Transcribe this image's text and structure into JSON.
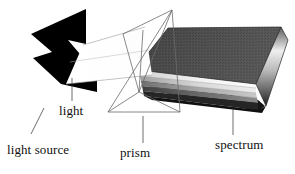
{
  "figure": {
    "width": 295,
    "height": 174,
    "background_color": "#ffffff",
    "style": "grayscale line-and-tone scientific illustration"
  },
  "labels": {
    "light": "light",
    "light_source": "light source",
    "prism": "prism",
    "spectrum": "spectrum"
  },
  "colors": {
    "background": "#ffffff",
    "ink": "#101010",
    "light_source_fill": "#000000",
    "prism_outline": "#6b6b6b",
    "beam_fill": "#ffffff",
    "beam_outline": "#9a9a9a",
    "spectrum_top": "#4a4a4a",
    "spectrum_top_dark": "#2f2f2f",
    "spectrum_base_dark": "#1a1a1a",
    "spectrum_band_light": "#f2f2f2",
    "spectrum_band_mid": "#bdbdbd",
    "leader_line": "#3a3a3a"
  },
  "elements": {
    "light_source": {
      "name": "light source",
      "description": "solid black chevron / lightning-bolt shaped emitter at the left",
      "fill": "#000000"
    },
    "light_beam": {
      "name": "light",
      "description": "thin white parallelogram beam travelling rightward from the source into the prism",
      "fill": "#ffffff",
      "outline": "#9a9a9a"
    },
    "prism": {
      "name": "prism",
      "description": "transparent triangular prism drawn as two overlapping wireframe triangles",
      "outline": "#6b6b6b",
      "apex_top": "upper right",
      "faces": 2
    },
    "spectrum": {
      "name": "spectrum",
      "description": "wedge-shaped slab fanning out to the right with a dark speckled top face and stacked light-to-dark bands along its front edge",
      "band_count": 6,
      "bands": [
        "#efefef",
        "#d6d6d6",
        "#b4b4b4",
        "#8e8e8e",
        "#5e5e5e",
        "#232323"
      ]
    }
  },
  "leader_lines": [
    {
      "name": "light-leader",
      "from_label": "light",
      "to_element": "light_beam"
    },
    {
      "name": "light-source-leader",
      "from_label": "light source",
      "to_element": "light_source"
    },
    {
      "name": "prism-leader",
      "from_label": "prism",
      "to_element": "prism"
    },
    {
      "name": "spectrum-leader",
      "from_label": "spectrum",
      "to_element": "spectrum"
    }
  ]
}
